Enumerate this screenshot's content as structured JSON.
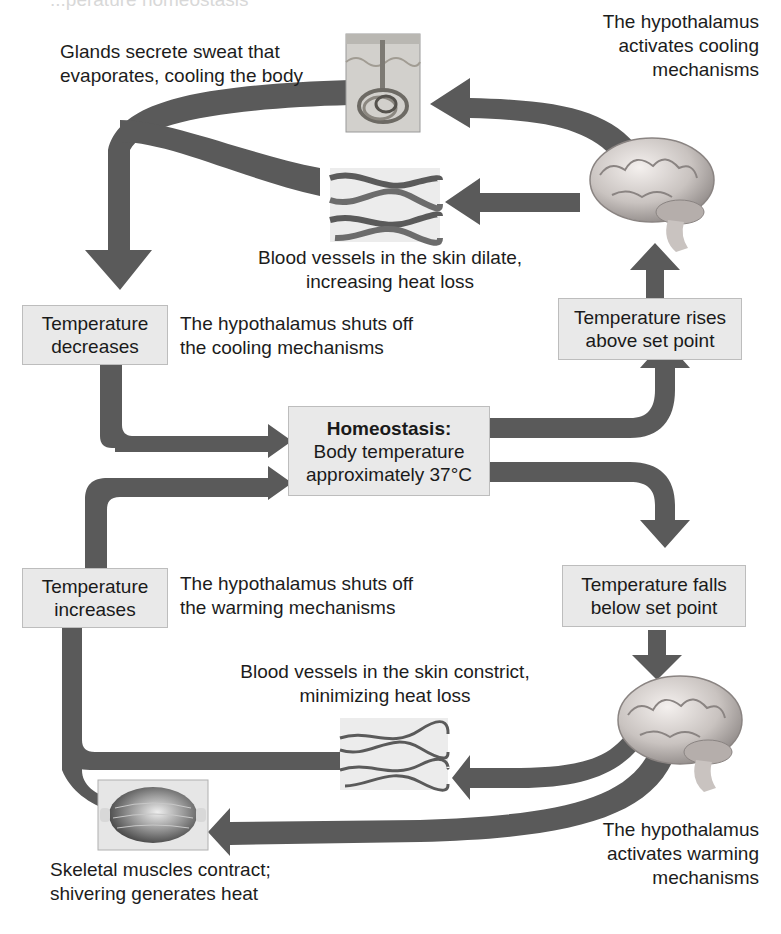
{
  "header_fragment": "...perature homeostasis",
  "homeostasis": {
    "title": "Homeostasis:",
    "line1": "Body temperature",
    "line2": "approximately 37°C"
  },
  "states": {
    "rises": [
      "Temperature rises",
      "above set point"
    ],
    "falls": [
      "Temperature falls",
      "below set point"
    ],
    "decreases": [
      "Temperature",
      "decreases"
    ],
    "increases": [
      "Temperature",
      "increases"
    ]
  },
  "labels": {
    "sweat": [
      "Glands secrete sweat that",
      "evaporates, cooling the body"
    ],
    "hypo_cooling": [
      "The hypothalamus",
      "activates cooling",
      "mechanisms"
    ],
    "dilate": [
      "Blood vessels in the skin dilate,",
      "increasing heat loss"
    ],
    "shuts_cooling": [
      "The hypothalamus shuts off",
      "the cooling mechanisms"
    ],
    "shuts_warming": [
      "The hypothalamus shuts off",
      "the warming mechanisms"
    ],
    "constrict": [
      "Blood vessels in the skin constrict,",
      "minimizing heat loss"
    ],
    "hypo_warming": [
      "The hypothalamus",
      "activates warming",
      "mechanisms"
    ],
    "shiver": [
      "Skeletal muscles contract;",
      "shivering generates heat"
    ]
  },
  "icons": {
    "sweat_gland": "sweat-gland-illustration",
    "vessels_dilated": "dilated-blood-vessels-illustration",
    "brain_top": "brain-illustration",
    "brain_bottom": "brain-illustration",
    "vessels_constricted": "constricted-blood-vessels-illustration",
    "muscle": "skeletal-muscle-illustration"
  },
  "colors": {
    "arrow": "#5a5a5a",
    "box_fill": "#e9e9e9",
    "box_border": "#bdbdbd",
    "text": "#1c1c1c"
  }
}
